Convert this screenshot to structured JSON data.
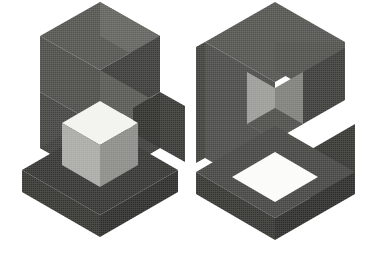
{
  "artwork": {
    "title": "Isometric 3D Block Logo",
    "description": "Two isometric cube-built letterforms rendered in flat grayscale facets on a white background",
    "background_color": "#ffffff",
    "canvas": {
      "width": 386,
      "height": 258
    },
    "palette": {
      "top_face_dark": "#52524f",
      "top_face_mid": "#5e5e5b",
      "left_face": "#4a4a47",
      "left_face_dark": "#3c3c39",
      "right_face_dark": "#33332f",
      "right_face_darkest": "#2b2b28",
      "inner_face_light": "#9a9a96",
      "inner_face_mid": "#7d7d79",
      "cube_top_white": "#f2f2ef",
      "cube_left_light": "#a9a9a5",
      "cube_right_mid": "#8a8a86",
      "hole_white": "#fbfbf9"
    },
    "glyphs": [
      {
        "name": "glyph-left",
        "letter": "S",
        "anchor_x": 100,
        "faces": [
          {
            "name": "top-face-upper-left",
            "fill": "#52524f",
            "points": "100,2 160,36 100,70 40,36"
          },
          {
            "name": "top-face-upper-right",
            "fill": "#61615e",
            "points": "100,2 160,36 160,60 128,52 100,36"
          },
          {
            "name": "upper-left-side",
            "fill": "#4b4b48",
            "points": "40,36 100,70 100,126 40,92"
          },
          {
            "name": "upper-right-side",
            "fill": "#3a3a37",
            "points": "100,70 160,36 160,92 100,126"
          },
          {
            "name": "mid-bridge-top",
            "fill": "#565653",
            "points": "100,70 160,104 133,120 100,101"
          },
          {
            "name": "right-column-face",
            "fill": "#2e2e2b",
            "points": "160,92 160,148 133,164 133,108"
          },
          {
            "name": "right-column-outer",
            "fill": "#363633",
            "points": "160,92 185,106 185,162 160,148"
          },
          {
            "name": "lower-left-side",
            "fill": "#42423f",
            "points": "40,92 100,126 100,182 40,148"
          },
          {
            "name": "bottom-slab-top",
            "fill": "#3b3b38",
            "points": "40,148 100,182 160,148 100,114"
          },
          {
            "name": "bottom-slab-left",
            "fill": "#33332f",
            "points": "22,170 100,215 100,237 22,192"
          },
          {
            "name": "bottom-slab-right",
            "fill": "#2b2b28",
            "points": "100,215 178,170 178,192 100,237"
          },
          {
            "name": "bottom-slab-face",
            "fill": "#333330",
            "points": "22,170 100,125 178,170 100,215"
          }
        ],
        "center_cube": {
          "name": "center-cube",
          "faces": [
            {
              "name": "cube-top-face",
              "fill": "#f2f2ef",
              "points": "100,101 138,123 100,145 62,123"
            },
            {
              "name": "cube-left-face",
              "fill": "#a9a9a5",
              "points": "62,123 100,145 100,187 62,165"
            },
            {
              "name": "cube-right-face",
              "fill": "#8a8a86",
              "points": "100,145 138,123 138,165 100,187"
            }
          ]
        }
      },
      {
        "name": "glyph-right",
        "letter": "G",
        "anchor_x": 275,
        "faces": [
          {
            "name": "top-face",
            "fill": "#52524f",
            "points": "275,2 345,42 275,82 205,42"
          },
          {
            "name": "top-face-right-wing",
            "fill": "#4e4e4b",
            "points": "275,42 345,42 345,70 310,90 275,70"
          },
          {
            "name": "left-outer-side",
            "fill": "#4a4a47",
            "points": "205,42 275,82 275,198 205,158"
          },
          {
            "name": "left-outer-shadow",
            "fill": "#3e3e3b",
            "points": "196,47 205,42 205,158 196,163"
          },
          {
            "name": "inner-notch-left",
            "fill": "#9a9a96",
            "points": "247,72 275,88 275,140 247,124"
          },
          {
            "name": "inner-notch-right",
            "fill": "#7d7d79",
            "points": "275,88 303,72 303,124 275,140"
          },
          {
            "name": "inner-notch-floor",
            "fill": "#4c4c49",
            "points": "247,124 275,140 303,124 275,108"
          },
          {
            "name": "upper-right-arm",
            "fill": "#3a3a37",
            "points": "303,72 345,48 345,100 303,124"
          },
          {
            "name": "lower-right-arm",
            "fill": "#343431",
            "points": "310,150 355,124 355,176 310,202"
          },
          {
            "name": "lower-slab-top",
            "fill": "#444441",
            "points": "275,126 355,172 275,218 196,172"
          },
          {
            "name": "lower-slab-left",
            "fill": "#33332f",
            "points": "196,172 275,218 275,240 196,194"
          },
          {
            "name": "lower-slab-right",
            "fill": "#2b2b28",
            "points": "275,218 355,172 355,194 275,240"
          }
        ],
        "hole": {
          "name": "lower-hole",
          "fill": "#fbfbf9",
          "points": "275,152 318,177 275,202 232,177"
        }
      }
    ]
  }
}
